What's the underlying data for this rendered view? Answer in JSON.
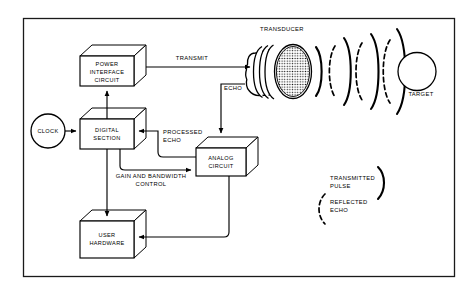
{
  "figure": {
    "frame": {
      "x": 23,
      "y": 18,
      "width": 432,
      "height": 259
    }
  },
  "colors": {
    "ink": "#000000",
    "paper": "#ffffff",
    "frame": "#1a1a1a"
  },
  "nodes": {
    "power_interface": {
      "label_lines": [
        "POWER",
        "INTERFACE",
        "CIRCUIT"
      ],
      "shape": "3d-box"
    },
    "digital_section": {
      "label_lines": [
        "DIGITAL",
        "SECTION"
      ],
      "shape": "3d-box"
    },
    "analog_circuit": {
      "label_lines": [
        "ANALOG",
        "CIRCUIT"
      ],
      "shape": "3d-box"
    },
    "user_hardware": {
      "label_lines": [
        "USER",
        "HARDWARE"
      ],
      "shape": "3d-box"
    },
    "clock": {
      "label": "CLOCK",
      "shape": "circle"
    },
    "transducer": {
      "label": "TRANSDUCER",
      "shape": "cylinder-stippled"
    },
    "target": {
      "label": "TARGET",
      "shape": "circle"
    }
  },
  "flows": {
    "transmit": {
      "label": "TRANSMIT"
    },
    "echo": {
      "label": "ECHO"
    },
    "processed_echo": {
      "label_lines": [
        "PROCESSED",
        "ECHO"
      ]
    },
    "gain_bandwidth": {
      "label_lines": [
        "GAIN AND BANDWIDTH",
        "CONTROL"
      ]
    }
  },
  "legend": {
    "transmitted_pulse": {
      "label_lines": [
        "TRANSMITTED",
        "PULSE"
      ],
      "style": "solid-arc"
    },
    "reflected_echo": {
      "label_lines": [
        "REFLECTED",
        "ECHO"
      ],
      "style": "dashed-arc"
    }
  },
  "wavefronts": {
    "transmitted_count": 4,
    "reflected_count": 3
  }
}
